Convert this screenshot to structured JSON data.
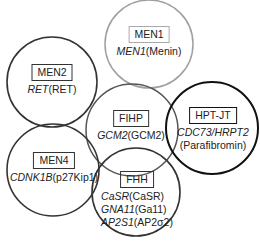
{
  "diagram": {
    "type": "overlapping-circles",
    "nodes": [
      {
        "id": "men1",
        "label": "MEN1",
        "genes": [
          {
            "gene": "MEN1",
            "protein": "(Menin)"
          }
        ],
        "cx": 149,
        "cy": 44,
        "r": 44,
        "stroke": "#a0a0a0",
        "strokeWidth": 1.5
      },
      {
        "id": "men2",
        "label": "MEN2",
        "genes": [
          {
            "gene": "RET",
            "protein": "(RET)"
          }
        ],
        "cx": 52,
        "cy": 82,
        "r": 45,
        "stroke": "#333333",
        "strokeWidth": 1.6
      },
      {
        "id": "fihp",
        "label": "FIHP",
        "genes": [
          {
            "gene": "GCM2",
            "protein": "(GCM2)"
          }
        ],
        "cx": 132,
        "cy": 130,
        "r": 46,
        "stroke": "#555555",
        "strokeWidth": 1.5
      },
      {
        "id": "hptjt",
        "label": "HPT-JT",
        "genes": [
          {
            "gene": "CDC73/HRPT2",
            "protein": ""
          },
          {
            "gene": "",
            "protein": "(Parafibromin)"
          }
        ],
        "cx": 212,
        "cy": 128,
        "r": 46,
        "stroke": "#111111",
        "strokeWidth": 2
      },
      {
        "id": "men4",
        "label": "MEN4",
        "genes": [
          {
            "gene": "CDNK1B",
            "protein": "(p27Kip1)"
          }
        ],
        "cx": 53,
        "cy": 170,
        "r": 46,
        "stroke": "#333333",
        "strokeWidth": 1.6
      },
      {
        "id": "fhh",
        "label": "FHH",
        "genes": [
          {
            "gene": "CaSR",
            "protein": "(CaSR)"
          },
          {
            "gene": "GNA11",
            "protein": "(Ga11)"
          },
          {
            "gene": "AP2S1",
            "protein": "(AP2σ2)"
          }
        ],
        "cx": 136,
        "cy": 192,
        "r": 44,
        "stroke": "#333333",
        "strokeWidth": 1.6
      }
    ]
  }
}
